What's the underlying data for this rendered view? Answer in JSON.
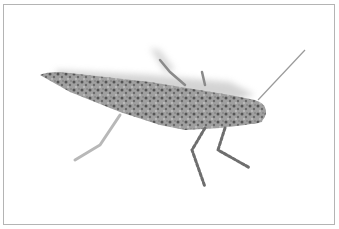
{
  "image": {
    "subject": "grasshopper",
    "style": "grayscale photograph on white background with thin gray frame",
    "colors": {
      "background": "#ffffff",
      "frame": "#b4b4b4",
      "body_light": "#a8a8a8",
      "body_dark": "#5a5a5a",
      "shadow": "#c8c8c8"
    }
  }
}
